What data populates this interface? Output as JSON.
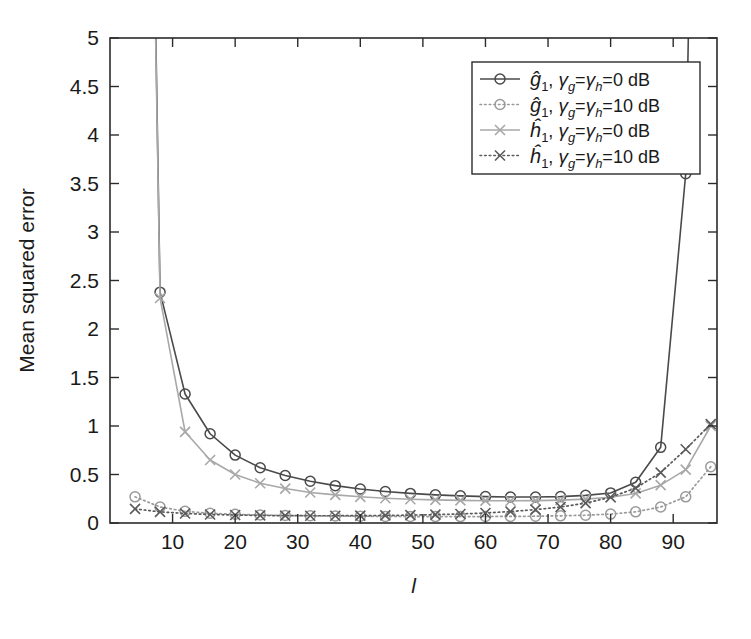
{
  "chart_data": {
    "type": "line",
    "title": "",
    "xlabel": "l",
    "ylabel": "Mean squared error",
    "xlim": [
      0,
      97
    ],
    "ylim": [
      0,
      5
    ],
    "xticks": [
      10,
      20,
      30,
      40,
      50,
      60,
      70,
      80,
      90
    ],
    "yticks": [
      0,
      0.5,
      1,
      1.5,
      2,
      2.5,
      3,
      3.5,
      4,
      4.5,
      5
    ],
    "ytick_labels": [
      "0",
      "0.5",
      "1",
      "1.5",
      "2",
      "2.5",
      "3",
      "3.5",
      "4",
      "4.5",
      "5"
    ],
    "xtick_labels": [
      "10",
      "20",
      "30",
      "40",
      "50",
      "60",
      "70",
      "80",
      "90"
    ],
    "grid": false,
    "legend_position": "top-right",
    "marker_x": [
      4,
      8,
      12,
      16,
      20,
      24,
      28,
      32,
      36,
      40,
      44,
      48,
      52,
      56,
      60,
      64,
      68,
      72,
      76,
      80,
      84,
      88,
      92,
      96
    ],
    "series": [
      {
        "name": "g1_0dB",
        "legend": "ĝ₁, γg=γh=0 dB",
        "color": "#4a4a4a",
        "line_style": "solid",
        "marker": "circle",
        "x": [
          4,
          8,
          12,
          16,
          20,
          24,
          28,
          32,
          36,
          40,
          44,
          48,
          52,
          56,
          60,
          64,
          68,
          72,
          76,
          80,
          84,
          88,
          92,
          96
        ],
        "y": [
          18.0,
          2.38,
          1.33,
          0.92,
          0.7,
          0.57,
          0.49,
          0.43,
          0.385,
          0.35,
          0.325,
          0.305,
          0.29,
          0.28,
          0.272,
          0.268,
          0.268,
          0.272,
          0.285,
          0.31,
          0.42,
          0.78,
          3.6,
          17.0
        ]
      },
      {
        "name": "g1_10dB",
        "legend": "ĝ₁, γg=γh=10 dB",
        "color": "#9a9a9a",
        "line_style": "dotted",
        "marker": "circle",
        "x": [
          4,
          8,
          12,
          16,
          20,
          24,
          28,
          32,
          36,
          40,
          44,
          48,
          52,
          56,
          60,
          64,
          68,
          72,
          76,
          80,
          84,
          88,
          92,
          96
        ],
        "y": [
          0.27,
          0.165,
          0.12,
          0.1,
          0.09,
          0.082,
          0.078,
          0.075,
          0.072,
          0.07,
          0.068,
          0.067,
          0.066,
          0.066,
          0.067,
          0.068,
          0.07,
          0.074,
          0.08,
          0.092,
          0.115,
          0.165,
          0.27,
          0.58
        ]
      },
      {
        "name": "h1_0dB",
        "legend": "ĥ₁, γg=γh=0 dB",
        "color": "#a8a8a8",
        "line_style": "solid",
        "marker": "cross",
        "x": [
          4,
          8,
          12,
          16,
          20,
          24,
          28,
          32,
          36,
          40,
          44,
          48,
          52,
          56,
          60,
          64,
          68,
          72,
          76,
          80,
          84,
          88,
          92,
          96
        ],
        "y": [
          17.5,
          2.32,
          0.94,
          0.65,
          0.5,
          0.41,
          0.355,
          0.315,
          0.29,
          0.27,
          0.255,
          0.245,
          0.238,
          0.233,
          0.23,
          0.229,
          0.231,
          0.236,
          0.246,
          0.265,
          0.305,
          0.39,
          0.55,
          1.0
        ]
      },
      {
        "name": "h1_10dB",
        "legend": "ĥ₁, γg=γh=10 dB",
        "color": "#5a5a5a",
        "line_style": "dotted",
        "marker": "cross",
        "x": [
          4,
          8,
          12,
          16,
          20,
          24,
          28,
          32,
          36,
          40,
          44,
          48,
          52,
          56,
          60,
          64,
          68,
          72,
          76,
          80,
          84,
          88,
          92,
          96
        ],
        "y": [
          0.145,
          0.115,
          0.098,
          0.088,
          0.082,
          0.078,
          0.076,
          0.075,
          0.075,
          0.076,
          0.078,
          0.081,
          0.086,
          0.093,
          0.103,
          0.118,
          0.138,
          0.165,
          0.205,
          0.265,
          0.36,
          0.52,
          0.76,
          1.02
        ]
      }
    ]
  },
  "legend": {
    "entries": [
      {
        "symbol_label": "g-hat-1",
        "text": "ĝ₁, γg=γh=0 dB",
        "pre": "ĝ",
        "sub": "1",
        "mid": ", ",
        "g1": "γ",
        "gsub": "g",
        "eq1": "=",
        "g2": "γ",
        "hsub": "h",
        "eq2": "=",
        "val": "0 dB"
      },
      {
        "symbol_label": "g-hat-1",
        "text": "ĝ₁, γg=γh=10 dB",
        "pre": "ĝ",
        "sub": "1",
        "mid": ", ",
        "g1": "γ",
        "gsub": "g",
        "eq1": "=",
        "g2": "γ",
        "hsub": "h",
        "eq2": "=",
        "val": "10 dB"
      },
      {
        "symbol_label": "h-hat-1",
        "text": "ĥ₁, γg=γh=0 dB",
        "pre": "ĥ",
        "sub": "1",
        "mid": ", ",
        "g1": "γ",
        "gsub": "g",
        "eq1": "=",
        "g2": "γ",
        "hsub": "h",
        "eq2": "=",
        "val": "0 dB"
      },
      {
        "symbol_label": "h-hat-1",
        "text": "ĥ₁, γg=γh=10 dB",
        "pre": "ĥ",
        "sub": "1",
        "mid": ", ",
        "g1": "γ",
        "gsub": "g",
        "eq1": "=",
        "g2": "γ",
        "hsub": "h",
        "eq2": "=",
        "val": "10 dB"
      }
    ]
  },
  "colors": {
    "axis": "#2b2b2b",
    "background": "#ffffff",
    "g1_0dB": "#4a4a4a",
    "g1_10dB": "#9a9a9a",
    "h1_0dB": "#a8a8a8",
    "h1_10dB": "#5a5a5a"
  }
}
